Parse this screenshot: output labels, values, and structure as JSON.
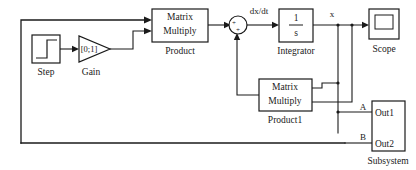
{
  "diagram": {
    "background_color": "#ffffff",
    "line_color": "#1a1a1a"
  },
  "blocks": {
    "step": {
      "name": "Step",
      "icon": "step-function-icon"
    },
    "gain": {
      "name": "Gain",
      "value": "[0;1]",
      "icon": "triangle-gain-icon"
    },
    "product": {
      "name": "Product",
      "line1": "Matrix",
      "line2": "Multiply"
    },
    "sum": {
      "name": "Sum",
      "sign_1": "+",
      "sign_2": "+",
      "icon": "circle-sum-icon"
    },
    "integrator": {
      "name": "Integrator",
      "numerator": "1",
      "denominator": "s"
    },
    "scope": {
      "name": "Scope",
      "icon": "scope-icon"
    },
    "product1": {
      "name": "Product1",
      "line1": "Matrix",
      "line2": "Multiply"
    },
    "subsystem": {
      "name": "Subsystem",
      "port1": "Out1",
      "port2": "Out2"
    }
  },
  "signals": {
    "dxdt": "dx/dt",
    "x": "x",
    "a": "A",
    "b": "B"
  }
}
